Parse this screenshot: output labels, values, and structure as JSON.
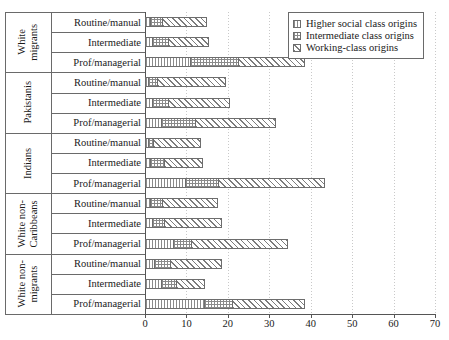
{
  "chart_data": {
    "type": "bar",
    "orientation": "horizontal",
    "stacked": true,
    "title": "",
    "xlabel": "",
    "ylabel": "",
    "xlim": [
      0,
      70
    ],
    "xticks": [
      0,
      10,
      20,
      30,
      40,
      50,
      60,
      70
    ],
    "grid": true,
    "legend_position": "top-right",
    "series": [
      {
        "name": "Higher social class origins",
        "pattern": "fine-vertical-dots"
      },
      {
        "name": "Intermediate class origins",
        "pattern": "cross-hatch-dots"
      },
      {
        "name": "Working-class origins",
        "pattern": "diagonal-hatch"
      }
    ],
    "groups": [
      {
        "name": "White\nmigrants",
        "categories": [
          "Routine/manual",
          "Intermediate",
          "Prof/managerial"
        ],
        "values": [
          [
            1.5,
            3.0,
            11.0
          ],
          [
            2.0,
            4.0,
            10.0
          ],
          [
            11.0,
            12.0,
            16.0
          ]
        ]
      },
      {
        "name": "Pakistanis",
        "categories": [
          "Routine/manual",
          "Intermediate",
          "Prof/managerial"
        ],
        "values": [
          [
            1.0,
            2.5,
            16.5
          ],
          [
            2.0,
            4.0,
            15.0
          ],
          [
            4.0,
            8.5,
            19.5
          ]
        ]
      },
      {
        "name": "Indians",
        "categories": [
          "Routine/manual",
          "Intermediate",
          "Prof/managerial"
        ],
        "values": [
          [
            1.0,
            1.5,
            11.5
          ],
          [
            1.5,
            3.5,
            9.5
          ],
          [
            10.0,
            8.0,
            26.0
          ]
        ]
      },
      {
        "name": "White non-\nCaribbeans",
        "categories": [
          "Routine/manual",
          "Intermediate",
          "Prof/managerial"
        ],
        "values": [
          [
            1.5,
            3.0,
            13.5
          ],
          [
            2.0,
            3.0,
            14.0
          ],
          [
            7.0,
            4.5,
            23.5
          ]
        ]
      },
      {
        "name": "White non-\nmigrants",
        "categories": [
          "Routine/manual",
          "Intermediate",
          "Prof/managerial"
        ],
        "values": [
          [
            2.5,
            4.0,
            12.5
          ],
          [
            4.0,
            4.0,
            7.0
          ],
          [
            14.5,
            7.0,
            17.5
          ]
        ]
      }
    ]
  },
  "legend": {
    "items": [
      "Higher social class origins",
      "Intermediate class origins",
      "Working-class origins"
    ]
  },
  "axis": {
    "xticklabels": [
      "0",
      "10",
      "20",
      "30",
      "40",
      "50",
      "60",
      "70"
    ]
  }
}
